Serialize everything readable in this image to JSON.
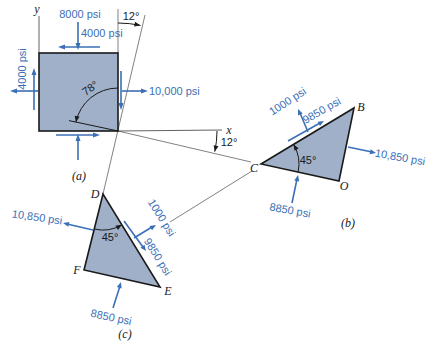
{
  "figure": {
    "panel_a": {
      "caption": "(a)",
      "axis_y_label": "y",
      "axis_x_label": "x",
      "top_normal_stress": "8000 psi",
      "top_shear_stress": "4000 psi",
      "left_shear_stress": "4000 psi",
      "right_normal_stress": "10,000 psi",
      "element_angle": "78°",
      "top_rotation_angle": "12°",
      "x_rotation_angle": "12°"
    },
    "panel_b": {
      "caption": "(b)",
      "vertex_b": "B",
      "vertex_c": "C",
      "vertex_o": "O",
      "angle": "45°",
      "normal_stress_cb": "1000 psi",
      "shear_stress_cb": "9850 psi",
      "normal_stress_ob": "10,850 psi",
      "normal_stress_co": "8850 psi"
    },
    "panel_c": {
      "caption": "(c)",
      "vertex_d": "D",
      "vertex_e": "E",
      "vertex_f": "F",
      "angle": "45°",
      "normal_stress_df": "10,850 psi",
      "normal_stress_de": "1000 psi",
      "shear_stress_de": "9850 psi",
      "normal_stress_fe": "8850 psi"
    }
  },
  "colors": {
    "stress_arrow": "#3b6fb6",
    "element_fill": "#9fb0c8",
    "outline": "#1a1a1a",
    "construction_line": "#4a4a4a"
  }
}
